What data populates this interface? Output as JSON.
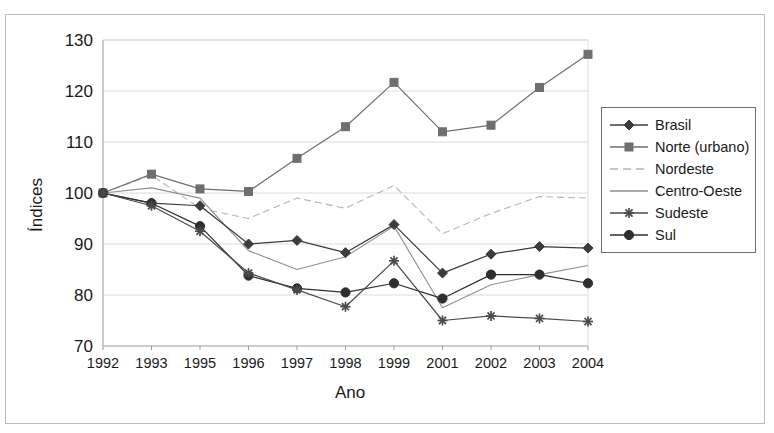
{
  "figure": {
    "title_strip": "",
    "y_axis_title": "Índices",
    "x_axis_title": "Ano"
  },
  "legend": {
    "items": [
      {
        "label": "Brasil",
        "marker": "diamond",
        "color": "#3c3c3c",
        "dash": "none"
      },
      {
        "label": "Norte (urbano)",
        "marker": "square",
        "color": "#6e6e6e",
        "dash": "none"
      },
      {
        "label": "Nordeste",
        "marker": "none",
        "color": "#b5b5b5",
        "dash": "dashed"
      },
      {
        "label": "Centro-Oeste",
        "marker": "none",
        "color": "#8f8f8f",
        "dash": "none"
      },
      {
        "label": "Sudeste",
        "marker": "asterisk",
        "color": "#4a4a4a",
        "dash": "none"
      },
      {
        "label": "Sul",
        "marker": "circle",
        "color": "#2e2e2e",
        "dash": "none"
      }
    ]
  },
  "chart_data": {
    "type": "line",
    "title": "",
    "xlabel": "Ano",
    "ylabel": "Índices",
    "categories": [
      "1992",
      "1993",
      "1995",
      "1996",
      "1997",
      "1998",
      "1999",
      "2001",
      "2002",
      "2003",
      "2004"
    ],
    "ylim": [
      70,
      130
    ],
    "yticks": [
      70,
      80,
      90,
      100,
      110,
      120,
      130
    ],
    "grid": true,
    "legend_position": "right",
    "series": [
      {
        "name": "Brasil",
        "marker": "diamond",
        "color": "#3c3c3c",
        "dash": "none",
        "values": [
          100,
          98,
          97.5,
          90,
          90.7,
          88.3,
          93.8,
          84.3,
          88,
          89.5,
          89.2
        ]
      },
      {
        "name": "Norte (urbano)",
        "marker": "square",
        "color": "#6e6e6e",
        "dash": "none",
        "values": [
          100,
          103.7,
          100.8,
          100.3,
          106.8,
          113,
          121.7,
          112,
          113.3,
          120.7,
          127.2
        ]
      },
      {
        "name": "Nordeste",
        "marker": "none",
        "color": "#b5b5b5",
        "dash": "dashed",
        "values": [
          100,
          103.5,
          97,
          95,
          99,
          97,
          101.5,
          92,
          96,
          99.3,
          99
        ]
      },
      {
        "name": "Centro-Oeste",
        "marker": "none",
        "color": "#8f8f8f",
        "dash": "none",
        "values": [
          100,
          101,
          99,
          88.7,
          85,
          87.5,
          93.5,
          77.5,
          82,
          84,
          85.8
        ]
      },
      {
        "name": "Sudeste",
        "marker": "asterisk",
        "color": "#4a4a4a",
        "dash": "none",
        "values": [
          100,
          97.5,
          92.5,
          84.3,
          81,
          77.7,
          86.7,
          75,
          75.9,
          75.4,
          74.8
        ]
      },
      {
        "name": "Sul",
        "marker": "circle",
        "color": "#2e2e2e",
        "dash": "none",
        "values": [
          100,
          98,
          93.5,
          83.8,
          81.3,
          80.5,
          82.3,
          79.3,
          84,
          84,
          82.3
        ]
      }
    ]
  }
}
